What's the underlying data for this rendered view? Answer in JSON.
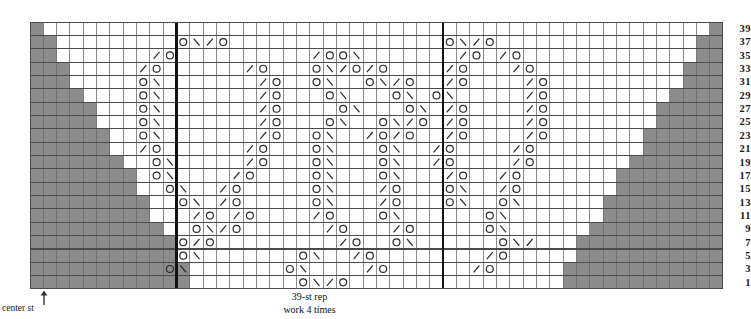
{
  "chart_data": {
    "type": "table",
    "grid": {
      "columns": 52,
      "rows": 20,
      "cell_w": 13.33,
      "cell_h": 13.35
    },
    "row_labels": [
      39,
      37,
      35,
      33,
      31,
      29,
      27,
      25,
      23,
      21,
      19,
      17,
      15,
      13,
      11,
      9,
      7,
      5,
      3,
      1
    ],
    "row_label_side": "right",
    "legend_symbols": {
      "O": "yarn-over",
      "\\": "ssk-left-leaning-decrease",
      "/": "k2tog-right-leaning-decrease",
      "gray": "no-stitch"
    },
    "colors": {
      "grid_line": "#4a4a4a",
      "grid_line_light": "#9a9a9a",
      "no_stitch_fill": "#8c8c8c",
      "rep_box": "#111111",
      "background": "#ffffff",
      "symbol": "#2a2a2a"
    },
    "rep_box": {
      "start_col": 11,
      "end_col": 31,
      "stitches": 39
    },
    "no_stitch_left": [
      1,
      2,
      3,
      4,
      5,
      6,
      7,
      8,
      9,
      10,
      11,
      12,
      13,
      14,
      15,
      16,
      17,
      18,
      19,
      20
    ],
    "no_stitch_right": [
      1,
      2,
      3,
      4,
      5,
      6,
      7,
      8,
      9,
      10,
      11,
      12,
      13,
      14,
      15,
      16,
      17,
      18,
      19,
      20
    ],
    "symbols": [
      {
        "row": 39,
        "cells": []
      },
      {
        "row": 37,
        "cells": [
          {
            "c": 11,
            "s": "O"
          },
          {
            "c": 12,
            "s": "\\"
          },
          {
            "c": 13,
            "s": "/"
          },
          {
            "c": 14,
            "s": "O"
          },
          {
            "c": 31,
            "s": "O"
          },
          {
            "c": 32,
            "s": "\\"
          },
          {
            "c": 33,
            "s": "/"
          },
          {
            "c": 34,
            "s": "O"
          }
        ]
      },
      {
        "row": 35,
        "cells": [
          {
            "c": 9,
            "s": "/"
          },
          {
            "c": 10,
            "s": "O"
          },
          {
            "c": 21,
            "s": "/"
          },
          {
            "c": 22,
            "s": "O"
          },
          {
            "c": 23,
            "s": "O"
          },
          {
            "c": 24,
            "s": "\\"
          },
          {
            "c": 32,
            "s": "/"
          },
          {
            "c": 33,
            "s": "O"
          },
          {
            "c": 35,
            "s": "/"
          },
          {
            "c": 36,
            "s": "O"
          }
        ]
      },
      {
        "row": 33,
        "cells": [
          {
            "c": 8,
            "s": "/"
          },
          {
            "c": 9,
            "s": "O"
          },
          {
            "c": 16,
            "s": "/"
          },
          {
            "c": 17,
            "s": "O"
          },
          {
            "c": 21,
            "s": "O"
          },
          {
            "c": 22,
            "s": "\\"
          },
          {
            "c": 23,
            "s": "/"
          },
          {
            "c": 24,
            "s": "O"
          },
          {
            "c": 25,
            "s": "/"
          },
          {
            "c": 26,
            "s": "O"
          },
          {
            "c": 31,
            "s": "/"
          },
          {
            "c": 32,
            "s": "O"
          },
          {
            "c": 36,
            "s": "/"
          },
          {
            "c": 37,
            "s": "O"
          }
        ]
      },
      {
        "row": 31,
        "cells": [
          {
            "c": 8,
            "s": "O"
          },
          {
            "c": 9,
            "s": "\\"
          },
          {
            "c": 17,
            "s": "/"
          },
          {
            "c": 18,
            "s": "O"
          },
          {
            "c": 21,
            "s": "O"
          },
          {
            "c": 22,
            "s": "\\"
          },
          {
            "c": 25,
            "s": "O"
          },
          {
            "c": 26,
            "s": "\\"
          },
          {
            "c": 27,
            "s": "/"
          },
          {
            "c": 28,
            "s": "O"
          },
          {
            "c": 31,
            "s": "/"
          },
          {
            "c": 32,
            "s": "O"
          },
          {
            "c": 37,
            "s": "/"
          },
          {
            "c": 38,
            "s": "O"
          }
        ]
      },
      {
        "row": 29,
        "cells": [
          {
            "c": 8,
            "s": "O"
          },
          {
            "c": 9,
            "s": "\\"
          },
          {
            "c": 17,
            "s": "/"
          },
          {
            "c": 18,
            "s": "O"
          },
          {
            "c": 22,
            "s": "O"
          },
          {
            "c": 23,
            "s": "\\"
          },
          {
            "c": 27,
            "s": "O"
          },
          {
            "c": 28,
            "s": "\\"
          },
          {
            "c": 30,
            "s": "O"
          },
          {
            "c": 31,
            "s": "\\"
          },
          {
            "c": 37,
            "s": "/"
          },
          {
            "c": 38,
            "s": "O"
          }
        ]
      },
      {
        "row": 27,
        "cells": [
          {
            "c": 8,
            "s": "O"
          },
          {
            "c": 9,
            "s": "\\"
          },
          {
            "c": 17,
            "s": "/"
          },
          {
            "c": 18,
            "s": "O"
          },
          {
            "c": 23,
            "s": "O"
          },
          {
            "c": 24,
            "s": "\\"
          },
          {
            "c": 28,
            "s": "O"
          },
          {
            "c": 29,
            "s": "\\"
          },
          {
            "c": 31,
            "s": "/"
          },
          {
            "c": 32,
            "s": "O"
          },
          {
            "c": 37,
            "s": "/"
          },
          {
            "c": 38,
            "s": "O"
          }
        ]
      },
      {
        "row": 25,
        "cells": [
          {
            "c": 8,
            "s": "O"
          },
          {
            "c": 9,
            "s": "\\"
          },
          {
            "c": 17,
            "s": "/"
          },
          {
            "c": 18,
            "s": "O"
          },
          {
            "c": 22,
            "s": "O"
          },
          {
            "c": 23,
            "s": "\\"
          },
          {
            "c": 26,
            "s": "O"
          },
          {
            "c": 27,
            "s": "\\"
          },
          {
            "c": 28,
            "s": "/"
          },
          {
            "c": 29,
            "s": "O"
          },
          {
            "c": 31,
            "s": "/"
          },
          {
            "c": 32,
            "s": "O"
          },
          {
            "c": 37,
            "s": "/"
          },
          {
            "c": 38,
            "s": "O"
          }
        ]
      },
      {
        "row": 23,
        "cells": [
          {
            "c": 8,
            "s": "O"
          },
          {
            "c": 9,
            "s": "\\"
          },
          {
            "c": 17,
            "s": "/"
          },
          {
            "c": 18,
            "s": "O"
          },
          {
            "c": 21,
            "s": "O"
          },
          {
            "c": 22,
            "s": "\\"
          },
          {
            "c": 25,
            "s": "/"
          },
          {
            "c": 26,
            "s": "O"
          },
          {
            "c": 27,
            "s": "/"
          },
          {
            "c": 28,
            "s": "O"
          },
          {
            "c": 31,
            "s": "/"
          },
          {
            "c": 32,
            "s": "O"
          },
          {
            "c": 37,
            "s": "/"
          },
          {
            "c": 38,
            "s": "O"
          }
        ]
      },
      {
        "row": 21,
        "cells": [
          {
            "c": 8,
            "s": "/"
          },
          {
            "c": 9,
            "s": "O"
          },
          {
            "c": 16,
            "s": "/"
          },
          {
            "c": 17,
            "s": "O"
          },
          {
            "c": 21,
            "s": "O"
          },
          {
            "c": 22,
            "s": "\\"
          },
          {
            "c": 26,
            "s": "O"
          },
          {
            "c": 27,
            "s": "\\"
          },
          {
            "c": 30,
            "s": "/"
          },
          {
            "c": 31,
            "s": "O"
          },
          {
            "c": 36,
            "s": "/"
          },
          {
            "c": 37,
            "s": "O"
          }
        ]
      },
      {
        "row": 19,
        "cells": [
          {
            "c": 9,
            "s": "O"
          },
          {
            "c": 10,
            "s": "\\"
          },
          {
            "c": 16,
            "s": "/"
          },
          {
            "c": 17,
            "s": "O"
          },
          {
            "c": 21,
            "s": "O"
          },
          {
            "c": 22,
            "s": "\\"
          },
          {
            "c": 26,
            "s": "O"
          },
          {
            "c": 27,
            "s": "\\"
          },
          {
            "c": 30,
            "s": "/"
          },
          {
            "c": 31,
            "s": "O"
          },
          {
            "c": 36,
            "s": "/"
          },
          {
            "c": 37,
            "s": "O"
          }
        ]
      },
      {
        "row": 17,
        "cells": [
          {
            "c": 9,
            "s": "O"
          },
          {
            "c": 10,
            "s": "\\"
          },
          {
            "c": 15,
            "s": "/"
          },
          {
            "c": 16,
            "s": "O"
          },
          {
            "c": 21,
            "s": "O"
          },
          {
            "c": 22,
            "s": "\\"
          },
          {
            "c": 26,
            "s": "O"
          },
          {
            "c": 27,
            "s": "\\"
          },
          {
            "c": 31,
            "s": "/"
          },
          {
            "c": 32,
            "s": "O"
          },
          {
            "c": 35,
            "s": "/"
          },
          {
            "c": 36,
            "s": "O"
          }
        ]
      },
      {
        "row": 15,
        "cells": [
          {
            "c": 10,
            "s": "O"
          },
          {
            "c": 11,
            "s": "\\"
          },
          {
            "c": 14,
            "s": "/"
          },
          {
            "c": 15,
            "s": "O"
          },
          {
            "c": 21,
            "s": "O"
          },
          {
            "c": 22,
            "s": "\\"
          },
          {
            "c": 26,
            "s": "/"
          },
          {
            "c": 27,
            "s": "O"
          },
          {
            "c": 31,
            "s": "O"
          },
          {
            "c": 32,
            "s": "\\"
          },
          {
            "c": 35,
            "s": "/"
          },
          {
            "c": 36,
            "s": "O"
          }
        ]
      },
      {
        "row": 13,
        "cells": [
          {
            "c": 11,
            "s": "O"
          },
          {
            "c": 12,
            "s": "\\"
          },
          {
            "c": 14,
            "s": "/"
          },
          {
            "c": 15,
            "s": "O"
          },
          {
            "c": 21,
            "s": "O"
          },
          {
            "c": 22,
            "s": "\\"
          },
          {
            "c": 26,
            "s": "/"
          },
          {
            "c": 27,
            "s": "O"
          },
          {
            "c": 31,
            "s": "O"
          },
          {
            "c": 32,
            "s": "\\"
          },
          {
            "c": 35,
            "s": "O"
          },
          {
            "c": 36,
            "s": "\\"
          }
        ]
      },
      {
        "row": 11,
        "cells": [
          {
            "c": 12,
            "s": "/"
          },
          {
            "c": 13,
            "s": "O"
          },
          {
            "c": 15,
            "s": "/"
          },
          {
            "c": 16,
            "s": "O"
          },
          {
            "c": 21,
            "s": "/"
          },
          {
            "c": 22,
            "s": "O"
          },
          {
            "c": 26,
            "s": "O"
          },
          {
            "c": 27,
            "s": "\\"
          },
          {
            "c": 34,
            "s": "O"
          },
          {
            "c": 35,
            "s": "\\"
          }
        ]
      },
      {
        "row": 9,
        "cells": [
          {
            "c": 12,
            "s": "O"
          },
          {
            "c": 13,
            "s": "\\"
          },
          {
            "c": 14,
            "s": "/"
          },
          {
            "c": 15,
            "s": "O"
          },
          {
            "c": 22,
            "s": "/"
          },
          {
            "c": 23,
            "s": "O"
          },
          {
            "c": 27,
            "s": "/"
          },
          {
            "c": 28,
            "s": "O"
          },
          {
            "c": 34,
            "s": "O"
          },
          {
            "c": 35,
            "s": "\\"
          }
        ]
      },
      {
        "row": 7,
        "cells": [
          {
            "c": 11,
            "s": "O"
          },
          {
            "c": 12,
            "s": "/"
          },
          {
            "c": 13,
            "s": "O"
          },
          {
            "c": 23,
            "s": "/"
          },
          {
            "c": 24,
            "s": "O"
          },
          {
            "c": 27,
            "s": "O"
          },
          {
            "c": 28,
            "s": "\\"
          },
          {
            "c": 35,
            "s": "O"
          },
          {
            "c": 36,
            "s": "\\"
          },
          {
            "c": 37,
            "s": "/"
          }
        ]
      },
      {
        "row": 5,
        "cells": [
          {
            "c": 11,
            "s": "O"
          },
          {
            "c": 12,
            "s": "\\"
          },
          {
            "c": 20,
            "s": "O"
          },
          {
            "c": 21,
            "s": "\\"
          },
          {
            "c": 24,
            "s": "/"
          },
          {
            "c": 25,
            "s": "O"
          },
          {
            "c": 34,
            "s": "/"
          },
          {
            "c": 35,
            "s": "O"
          }
        ]
      },
      {
        "row": 3,
        "cells": [
          {
            "c": 10,
            "s": "O"
          },
          {
            "c": 11,
            "s": "\\"
          },
          {
            "c": 19,
            "s": "O"
          },
          {
            "c": 20,
            "s": "\\"
          },
          {
            "c": 25,
            "s": "/"
          },
          {
            "c": 26,
            "s": "O"
          },
          {
            "c": 33,
            "s": "/"
          },
          {
            "c": 34,
            "s": "O"
          }
        ]
      },
      {
        "row": 1,
        "cells": [
          {
            "c": 20,
            "s": "O"
          },
          {
            "c": 21,
            "s": "\\"
          },
          {
            "c": 22,
            "s": "/"
          },
          {
            "c": 23,
            "s": "O"
          }
        ]
      }
    ]
  },
  "labels": {
    "center_st": "center st",
    "rep_line1": "39-st rep",
    "rep_line2": "work 4 times",
    "top_clip": ""
  }
}
